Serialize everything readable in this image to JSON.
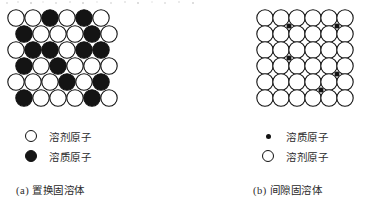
{
  "figure": {
    "panels": [
      {
        "id": "panel-a",
        "caption": "(a) 置换固溶体",
        "lattice": {
          "type": "substitutional",
          "rows": 6,
          "cols": 6,
          "circle_diameter": 18,
          "row_pitch": 16,
          "col_pitch": 17,
          "row_offsets": [
            0,
            8,
            0,
            8,
            0,
            8
          ],
          "open_fill": "#ffffff",
          "filled_fill": "#141414",
          "stroke": "#111111",
          "grid": [
            [
              "open",
              "open",
              "filled",
              "open",
              "filled",
              "open"
            ],
            [
              "filled",
              "open",
              "open",
              "open",
              "filled",
              "open"
            ],
            [
              "open",
              "filled",
              "filled",
              "open",
              "filled",
              "filled"
            ],
            [
              "filled",
              "open",
              "filled",
              "open",
              "open",
              "open"
            ],
            [
              "open",
              "open",
              "open",
              "filled",
              "open",
              "filled"
            ],
            [
              "filled",
              "open",
              "open",
              "open",
              "filled",
              "open"
            ]
          ]
        },
        "legend": [
          {
            "marker": "circle-open",
            "label": "溶剂原子"
          },
          {
            "marker": "circle-filled",
            "label": "溶质原子"
          }
        ]
      },
      {
        "id": "panel-b",
        "caption": "(b) 间隙固溶体",
        "lattice": {
          "type": "interstitial",
          "rows": 6,
          "cols": 6,
          "circle_diameter": 18,
          "row_pitch": 16,
          "col_pitch": 16,
          "open_fill": "#ffffff",
          "stroke": "#111111",
          "interstitial_dot_color": "#131313",
          "interstitial_dot_diameter": 5,
          "interstitial_sites": [
            {
              "col": 1.5,
              "row": 0.5
            },
            {
              "col": 4.5,
              "row": 0.5
            },
            {
              "col": 1.5,
              "row": 2.5
            },
            {
              "col": 4.5,
              "row": 3.5
            },
            {
              "col": 3.5,
              "row": 4.5
            }
          ]
        },
        "legend": [
          {
            "marker": "dot-small",
            "label": "溶质原子"
          },
          {
            "marker": "circle-open",
            "label": "溶剂原子"
          }
        ]
      }
    ]
  }
}
